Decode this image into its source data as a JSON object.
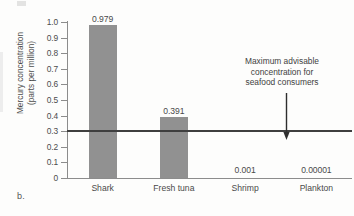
{
  "figure": {
    "letter": "b.",
    "axis_color": "#8c8c8c",
    "bar_color": "#919191",
    "threshold_color": "#3f3f3f",
    "text_color": "#4a4a4a"
  },
  "annotation": {
    "line1": "Maximum advisable",
    "line2": "concentration for",
    "line3": "seafood consumers"
  },
  "ytitle": {
    "line1": "Mercury concentration",
    "line2": "(parts per million)"
  },
  "chart_data": {
    "type": "bar",
    "title": "",
    "xlabel": "",
    "ylabel": "Mercury concentration (parts per million)",
    "ylim": [
      0,
      1.0
    ],
    "ytick_labels": [
      "1.0",
      "0.9",
      "0.8",
      "0.7",
      "0.6",
      "0.5",
      "0.4",
      "0.3",
      "0.2",
      "0.1",
      "0"
    ],
    "ytick_values": [
      1.0,
      0.9,
      0.8,
      0.7,
      0.6,
      0.5,
      0.4,
      0.3,
      0.2,
      0.1,
      0
    ],
    "grid": false,
    "legend": "none",
    "categories": [
      "Shark",
      "Fresh tuna",
      "Shrimp",
      "Plankton"
    ],
    "values": [
      0.979,
      0.391,
      0.001,
      1e-05
    ],
    "value_labels": [
      "0.979",
      "0.391",
      "0.001",
      "0.00001"
    ],
    "threshold": {
      "value": 0.3,
      "label": "Maximum advisable concentration for seafood consumers"
    }
  }
}
